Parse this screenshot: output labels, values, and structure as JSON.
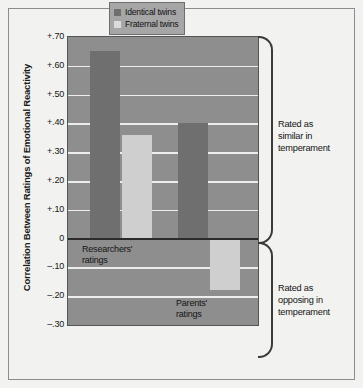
{
  "chart_data": {
    "type": "bar",
    "title": "",
    "xlabel": "",
    "ylabel": "Correlation Between Ratings of Emotional Reactivity",
    "ylim": [
      -0.3,
      0.7
    ],
    "grid": true,
    "legend_position": "top-right",
    "categories": [
      "Researchers' ratings",
      "Parents' ratings"
    ],
    "series": [
      {
        "name": "Identical twins",
        "values": [
          0.65,
          0.4
        ],
        "color": "#6f6f6f"
      },
      {
        "name": "Fraternal twins",
        "values": [
          0.36,
          -0.18
        ],
        "color": "#cfcfcf"
      }
    ],
    "yticks": [
      {
        "label": "+.70",
        "value": 0.7
      },
      {
        "label": "+.60",
        "value": 0.6
      },
      {
        "label": "+.50",
        "value": 0.5
      },
      {
        "label": "+.40",
        "value": 0.4
      },
      {
        "label": "+.30",
        "value": 0.3
      },
      {
        "label": "+.20",
        "value": 0.2
      },
      {
        "label": "+.10",
        "value": 0.1
      },
      {
        "label": "0",
        "value": 0.0
      },
      {
        "label": "–.10",
        "value": -0.1
      },
      {
        "label": "–.20",
        "value": -0.2
      },
      {
        "label": "–.30",
        "value": -0.3
      }
    ],
    "annotations": [
      {
        "name": "top-bracket",
        "lines": [
          "Rated as",
          "similar in",
          "temperament"
        ]
      },
      {
        "name": "bottom-bracket",
        "lines": [
          "Rated as",
          "opposing in",
          "temperament"
        ]
      }
    ],
    "group_labels": [
      {
        "line1": "Researchers'",
        "line2": "ratings"
      },
      {
        "line1": "Parents'",
        "line2": "ratings"
      }
    ]
  },
  "legend": {
    "items": [
      {
        "label": "Identical twins"
      },
      {
        "label": "Fraternal twins"
      }
    ]
  },
  "side": {
    "top": {
      "line1": "Rated as",
      "line2": "similar in",
      "line3": "temperament"
    },
    "bottom": {
      "line1": "Rated as",
      "line2": "opposing in",
      "line3": "temperament"
    }
  },
  "groups": {
    "researchers": {
      "line1": "Researchers'",
      "line2": "ratings"
    },
    "parents": {
      "line1": "Parents'",
      "line2": "ratings"
    }
  },
  "axis": {
    "ylabel": "Correlation Between Ratings of Emotional Reactivity"
  }
}
